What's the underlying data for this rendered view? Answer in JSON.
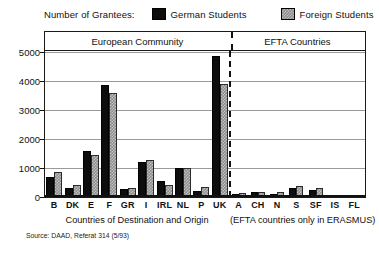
{
  "legend": {
    "title": "Number of Grantees:",
    "entries": [
      {
        "label": "German Students",
        "color": "#0d0d0d",
        "icon": "filled-square-icon"
      },
      {
        "label": "Foreign Students",
        "color": "#8e8e8e",
        "icon": "hatched-square-icon"
      }
    ]
  },
  "groups": {
    "ec_header": "European Community",
    "efta_header": "EFTA Countries"
  },
  "captions": {
    "ec": "Countries of Destination and Origin",
    "efta": "(EFTA countries only in ERASMUS)",
    "source": "Source: DAAD, Referat 314 (5/93)"
  },
  "chart_data": {
    "type": "bar",
    "title": "Number of Grantees:",
    "xlabel": "Countries of Destination and Origin",
    "ylabel": "",
    "ylim": [
      0,
      5000
    ],
    "yticks": [
      0,
      1000,
      2000,
      3000,
      4000,
      5000
    ],
    "grid": true,
    "legend_position": "top",
    "categories": [
      "B",
      "DK",
      "E",
      "F",
      "GR",
      "I",
      "IRL",
      "NL",
      "P",
      "UK",
      "A",
      "CH",
      "N",
      "S",
      "SF",
      "IS",
      "FL"
    ],
    "group_of_category": [
      "EC",
      "EC",
      "EC",
      "EC",
      "EC",
      "EC",
      "EC",
      "EC",
      "EC",
      "EC",
      "EFTA",
      "EFTA",
      "EFTA",
      "EFTA",
      "EFTA",
      "EFTA",
      "EFTA"
    ],
    "series": [
      {
        "name": "German Students",
        "color": "#0d0d0d",
        "values": [
          700,
          300,
          1600,
          3850,
          260,
          1200,
          550,
          1000,
          220,
          4850,
          120,
          180,
          120,
          320,
          250,
          0,
          0
        ]
      },
      {
        "name": "Foreign Students",
        "color": "#8e8e8e",
        "values": [
          850,
          400,
          1450,
          3600,
          320,
          1280,
          400,
          1000,
          330,
          3900,
          130,
          190,
          180,
          380,
          300,
          0,
          0
        ]
      }
    ]
  }
}
